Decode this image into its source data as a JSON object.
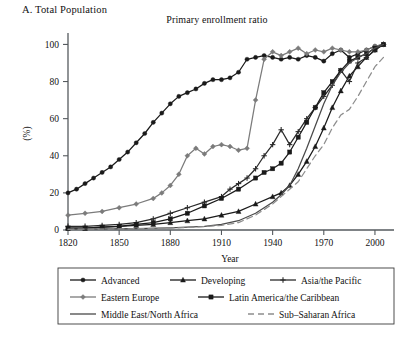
{
  "panel_label": "A. Total Population",
  "axis": {
    "ylabel": "(%)",
    "xlabel": "Year",
    "x_ticks": [
      "1820",
      "1850",
      "1880",
      "1910",
      "1940",
      "1970",
      "2000"
    ],
    "y_ticks": [
      "0",
      "20",
      "40",
      "60",
      "80",
      "100"
    ]
  },
  "legend": {
    "items": [
      {
        "label": "Advanced",
        "marker": "filled-circle-icon",
        "color": "#1a1a1a",
        "dash": "none"
      },
      {
        "label": "Developing",
        "marker": "filled-triangle-icon",
        "color": "#1a1a1a",
        "dash": "none"
      },
      {
        "label": "Asia/the Pacific",
        "marker": "plus-cross-icon",
        "color": "#2a2a2a",
        "dash": "none"
      },
      {
        "label": "Eastern Europe",
        "marker": "filled-diamond-icon",
        "color": "#7b7b7b",
        "dash": "none"
      },
      {
        "label": "Latin America/the Caribbean",
        "marker": "filled-square-icon",
        "color": "#1a1a1a",
        "dash": "none"
      },
      {
        "label": "Middle East/North Africa",
        "marker": "no-marker-line-icon",
        "color": "#4a4a4a",
        "dash": "none"
      },
      {
        "label": "Sub–Saharan Africa",
        "marker": "dashed-line-icon",
        "color": "#8d8d8d",
        "dash": "6,4"
      }
    ]
  },
  "chart_data": {
    "type": "line",
    "title": "Primary enrollment ratio",
    "xlabel": "Year",
    "ylabel": "(%)",
    "xlim": [
      1820,
      2010
    ],
    "ylim": [
      0,
      104
    ],
    "grid": false,
    "legend_position": "below-axes",
    "series": [
      {
        "name": "Advanced",
        "color": "#1a1a1a",
        "marker": "filled-circle",
        "x": [
          1820,
          1825,
          1830,
          1835,
          1840,
          1845,
          1850,
          1855,
          1860,
          1865,
          1870,
          1875,
          1880,
          1885,
          1890,
          1895,
          1900,
          1905,
          1910,
          1915,
          1920,
          1925,
          1930,
          1935,
          1940,
          1945,
          1950,
          1955,
          1960,
          1965,
          1970,
          1975,
          1980,
          1985,
          1990,
          1995,
          2000,
          2005
        ],
        "values": [
          20,
          22,
          25,
          28,
          31,
          34,
          38,
          42,
          47,
          52,
          58,
          63,
          68,
          72,
          74,
          76,
          79,
          81,
          81,
          82,
          85,
          92,
          93,
          94,
          93,
          92,
          93,
          92,
          94,
          93,
          91,
          95,
          97,
          93,
          95,
          97,
          99,
          100
        ]
      },
      {
        "name": "Developing",
        "color": "#1a1a1a",
        "marker": "filled-triangle",
        "x": [
          1820,
          1830,
          1840,
          1850,
          1860,
          1870,
          1880,
          1890,
          1900,
          1910,
          1920,
          1930,
          1940,
          1945,
          1950,
          1955,
          1960,
          1965,
          1970,
          1975,
          1980,
          1985,
          1990,
          1995,
          2000,
          2005
        ],
        "values": [
          1,
          1,
          1.5,
          2,
          2.5,
          3,
          4,
          5,
          6,
          8,
          10,
          14,
          18,
          20,
          24,
          30,
          37,
          45,
          55,
          66,
          75,
          83,
          88,
          93,
          97,
          100
        ]
      },
      {
        "name": "Asia/the Pacific",
        "color": "#2a2a2a",
        "marker": "plus-cross",
        "x": [
          1820,
          1830,
          1840,
          1850,
          1860,
          1870,
          1880,
          1890,
          1900,
          1910,
          1915,
          1920,
          1925,
          1930,
          1935,
          1940,
          1945,
          1950,
          1955,
          1960,
          1965,
          1970,
          1975,
          1980,
          1985,
          1990,
          1995,
          2000,
          2005
        ],
        "values": [
          2,
          2,
          2.5,
          3,
          4,
          6,
          9,
          12,
          15,
          18,
          22,
          25,
          28,
          33,
          40,
          46,
          54,
          46,
          53,
          60,
          66,
          72,
          78,
          86,
          80,
          90,
          93,
          97,
          100
        ]
      },
      {
        "name": "Eastern Europe",
        "color": "#7b7b7b",
        "marker": "filled-diamond",
        "x": [
          1820,
          1830,
          1840,
          1850,
          1860,
          1870,
          1875,
          1880,
          1885,
          1890,
          1895,
          1900,
          1905,
          1910,
          1915,
          1920,
          1925,
          1930,
          1935,
          1940,
          1945,
          1950,
          1955,
          1960,
          1965,
          1970,
          1975,
          1980,
          1985,
          1990,
          1995,
          2000,
          2005
        ],
        "values": [
          8,
          9,
          10,
          12,
          14,
          17,
          20,
          24,
          30,
          40,
          44,
          41,
          45,
          46,
          45,
          43,
          44,
          70,
          92,
          96,
          94,
          96,
          98,
          95,
          97,
          96,
          98,
          97,
          96,
          96,
          97,
          99,
          100
        ]
      },
      {
        "name": "Latin America/the Caribbean",
        "color": "#1a1a1a",
        "marker": "filled-square",
        "x": [
          1820,
          1830,
          1840,
          1850,
          1860,
          1870,
          1880,
          1890,
          1900,
          1910,
          1920,
          1930,
          1935,
          1940,
          1945,
          1950,
          1955,
          1960,
          1965,
          1970,
          1975,
          1980,
          1985,
          1990,
          1995,
          2000,
          2005
        ],
        "values": [
          1,
          1,
          1.5,
          2,
          3,
          4,
          6,
          9,
          13,
          17,
          22,
          28,
          31,
          33,
          36,
          42,
          50,
          58,
          66,
          74,
          80,
          86,
          91,
          93,
          95,
          98,
          100
        ]
      },
      {
        "name": "Middle East/North Africa",
        "color": "#4a4a4a",
        "marker": "none",
        "x": [
          1820,
          1840,
          1860,
          1880,
          1900,
          1910,
          1920,
          1930,
          1940,
          1945,
          1950,
          1955,
          1960,
          1965,
          1970,
          1975,
          1980,
          1985,
          1990,
          1995,
          2000,
          2005
        ],
        "values": [
          0.5,
          0.6,
          0.8,
          1.2,
          2,
          3,
          5,
          9,
          15,
          19,
          24,
          33,
          44,
          56,
          68,
          78,
          85,
          90,
          93,
          95,
          98,
          100
        ]
      },
      {
        "name": "Sub–Saharan Africa",
        "color": "#8d8d8d",
        "marker": "none",
        "dash": "6,4",
        "x": [
          1820,
          1840,
          1860,
          1880,
          1900,
          1910,
          1920,
          1930,
          1940,
          1945,
          1950,
          1955,
          1960,
          1965,
          1970,
          1975,
          1980,
          1985,
          1990,
          1995,
          2000,
          2005
        ],
        "values": [
          0.4,
          0.5,
          0.7,
          1,
          1.8,
          2.5,
          4,
          8,
          14,
          18,
          22,
          26,
          33,
          40,
          46,
          55,
          62,
          65,
          72,
          80,
          88,
          93
        ]
      }
    ]
  }
}
